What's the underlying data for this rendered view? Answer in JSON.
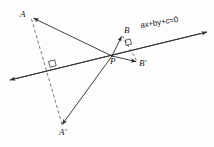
{
  "figure": {
    "width": 214,
    "height": 147,
    "background_color": "#fdfdfd",
    "stroke_color": "#2b2b2b"
  },
  "labels": {
    "point_a": "A",
    "point_a_prime": "A'",
    "point_b": "B",
    "point_b_prime": "B'",
    "point_p": "P",
    "line_equation": "ax+by+c=0"
  },
  "geometry": {
    "line": {
      "name": "mirror-line",
      "start": [
        10,
        80
      ],
      "end": [
        207,
        32
      ],
      "arrow_start": true,
      "arrow_end": true,
      "style": "solid"
    },
    "points": {
      "A": [
        31,
        17
      ],
      "A_prime": [
        63,
        127
      ],
      "B": [
        123,
        34
      ],
      "B_prime": [
        138,
        63
      ],
      "P": [
        112,
        56
      ],
      "foot_AA": [
        53,
        66
      ]
    },
    "segments": [
      {
        "name": "segment-P-to-A",
        "from": [
          112,
          56
        ],
        "to": [
          31,
          17
        ],
        "style": "solid",
        "arrow_end": true
      },
      {
        "name": "segment-P-to-A-prime",
        "from": [
          112,
          56
        ],
        "to": [
          63,
          127
        ],
        "style": "solid",
        "arrow_end": true
      },
      {
        "name": "segment-P-to-B",
        "from": [
          112,
          56
        ],
        "to": [
          123,
          34
        ],
        "style": "solid",
        "arrow_end": true
      },
      {
        "name": "segment-P-to-B-prime",
        "from": [
          112,
          56
        ],
        "to": [
          138,
          63
        ],
        "style": "solid",
        "arrow_end": true
      },
      {
        "name": "segment-A-to-A-prime-dashed",
        "from": [
          31,
          17
        ],
        "to": [
          63,
          127
        ],
        "style": "dashed",
        "arrow_end": false
      },
      {
        "name": "segment-B-to-B-prime-dashed",
        "from": [
          123,
          34
        ],
        "to": [
          138,
          63
        ],
        "style": "dashed",
        "arrow_end": false
      }
    ],
    "right_angle_markers": [
      {
        "name": "right-angle-marker-AA-foot",
        "at": [
          53,
          66
        ]
      },
      {
        "name": "right-angle-marker-BB-foot",
        "at": [
          129,
          44
        ]
      }
    ]
  }
}
